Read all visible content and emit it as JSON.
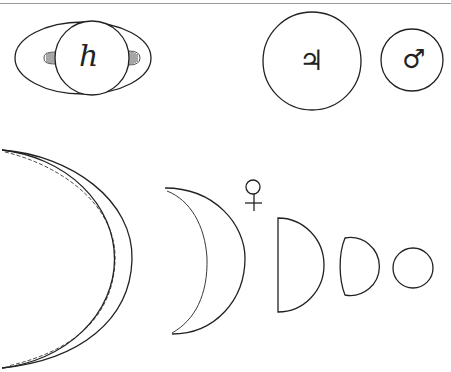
{
  "figure": {
    "colors": {
      "ink": "#222222",
      "rule": "#9a9a9a",
      "background": "#ffffff"
    }
  },
  "planets": {
    "saturn": {
      "symbol": "h",
      "name": "Saturn"
    },
    "jupiter": {
      "symbol": "♃",
      "name": "Jupiter"
    },
    "mars": {
      "symbol": "♂",
      "name": "Mars"
    },
    "venus": {
      "symbol": "♀",
      "name": "Venus",
      "phases": [
        "crescent-large",
        "crescent-medium",
        "half",
        "gibbous",
        "full"
      ]
    }
  }
}
